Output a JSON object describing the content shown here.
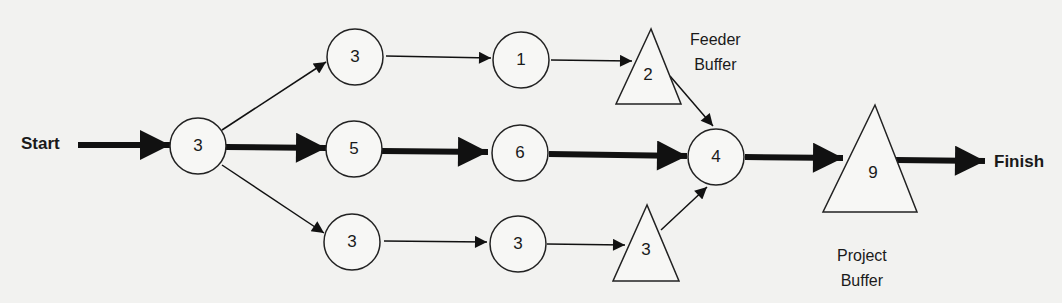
{
  "diagram": {
    "terminals": {
      "start": "Start",
      "finish": "Finish"
    },
    "tasks": [
      {
        "id": "t1",
        "shape": "circle",
        "value": "3"
      },
      {
        "id": "t2",
        "shape": "circle",
        "value": "3"
      },
      {
        "id": "t3",
        "shape": "circle",
        "value": "5"
      },
      {
        "id": "t4",
        "shape": "circle",
        "value": "3"
      },
      {
        "id": "t5",
        "shape": "circle",
        "value": "1"
      },
      {
        "id": "t6",
        "shape": "circle",
        "value": "6"
      },
      {
        "id": "t7",
        "shape": "circle",
        "value": "3"
      },
      {
        "id": "t8",
        "shape": "circle",
        "value": "4"
      }
    ],
    "buffers": [
      {
        "id": "fb1",
        "shape": "triangle",
        "value": "2",
        "type": "feeder"
      },
      {
        "id": "fb2",
        "shape": "triangle",
        "value": "3",
        "type": "feeder"
      },
      {
        "id": "pb",
        "shape": "triangle",
        "value": "9",
        "type": "project"
      }
    ],
    "labels": {
      "feeder_buffer": [
        "Feeder",
        "Buffer"
      ],
      "project_buffer": [
        "Project",
        "Buffer"
      ]
    },
    "edges": [
      {
        "from": "start",
        "to": "t1",
        "critical": true
      },
      {
        "from": "t1",
        "to": "t2",
        "critical": false
      },
      {
        "from": "t1",
        "to": "t3",
        "critical": true
      },
      {
        "from": "t1",
        "to": "t4",
        "critical": false
      },
      {
        "from": "t2",
        "to": "t5",
        "critical": false
      },
      {
        "from": "t5",
        "to": "fb1",
        "critical": false
      },
      {
        "from": "fb1",
        "to": "t8",
        "critical": false
      },
      {
        "from": "t3",
        "to": "t6",
        "critical": true
      },
      {
        "from": "t6",
        "to": "t8",
        "critical": true
      },
      {
        "from": "t4",
        "to": "t7",
        "critical": false
      },
      {
        "from": "t7",
        "to": "fb2",
        "critical": false
      },
      {
        "from": "fb2",
        "to": "t8",
        "critical": false
      },
      {
        "from": "t8",
        "to": "pb",
        "critical": true
      },
      {
        "from": "pb",
        "to": "finish",
        "critical": true
      }
    ]
  }
}
